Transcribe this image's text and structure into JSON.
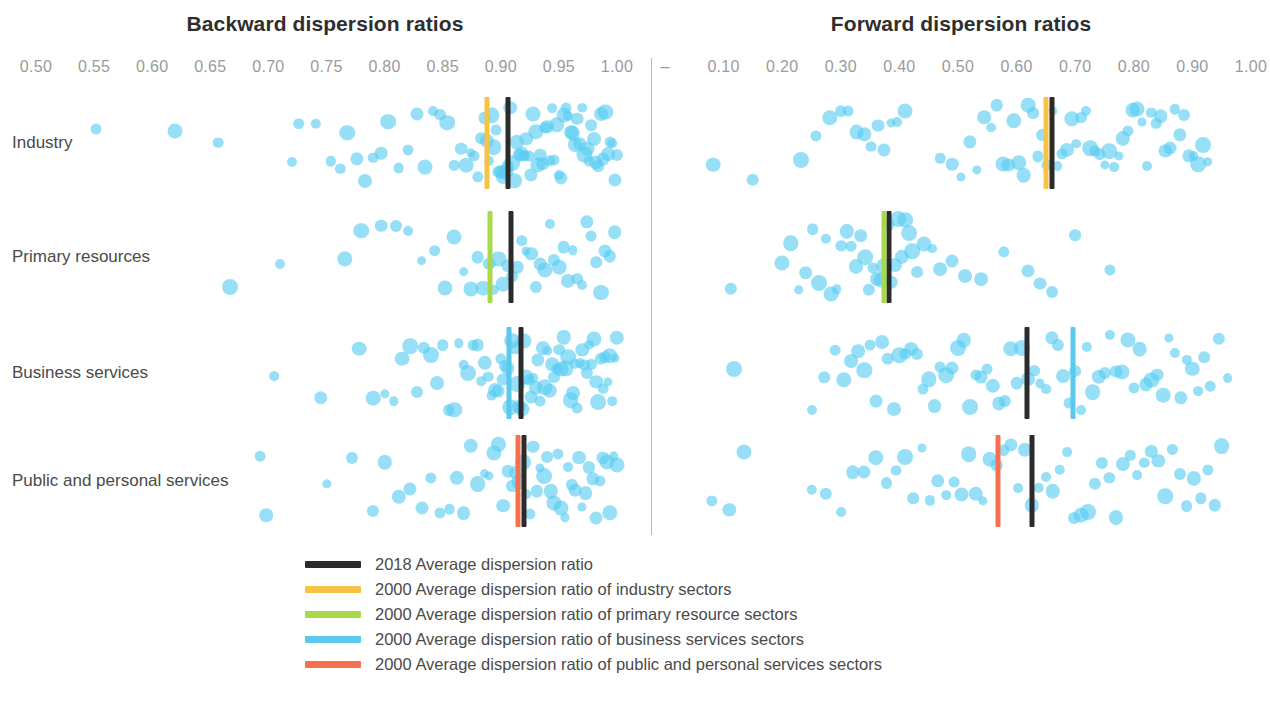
{
  "chart_data": {
    "type": "scatter",
    "panels": [
      {
        "name": "backward",
        "title": "Backward dispersion ratios",
        "xlabel": "",
        "xlim": [
          0.475,
          1.015
        ],
        "ticks": [
          {
            "value": 0.5,
            "label": "0.50"
          },
          {
            "value": 0.55,
            "label": "0.55"
          },
          {
            "value": 0.6,
            "label": "0.60"
          },
          {
            "value": 0.65,
            "label": "0.65"
          },
          {
            "value": 0.7,
            "label": "0.70"
          },
          {
            "value": 0.75,
            "label": "0.75"
          },
          {
            "value": 0.8,
            "label": "0.80"
          },
          {
            "value": 0.85,
            "label": "0.85"
          },
          {
            "value": 0.9,
            "label": "0.90"
          },
          {
            "value": 0.95,
            "label": "0.95"
          },
          {
            "value": 1.0,
            "label": "1.00"
          }
        ]
      },
      {
        "name": "forward",
        "title": "Forward dispersion ratios",
        "xlabel": "",
        "xlim": [
          0.0,
          1.03
        ],
        "ticks": [
          {
            "value": 0.0,
            "label": "–"
          },
          {
            "value": 0.1,
            "label": "0.10"
          },
          {
            "value": 0.2,
            "label": "0.20"
          },
          {
            "value": 0.3,
            "label": "0.30"
          },
          {
            "value": 0.4,
            "label": "0.40"
          },
          {
            "value": 0.5,
            "label": "0.50"
          },
          {
            "value": 0.6,
            "label": "0.60"
          },
          {
            "value": 0.7,
            "label": "0.70"
          },
          {
            "value": 0.8,
            "label": "0.80"
          },
          {
            "value": 0.9,
            "label": "0.90"
          },
          {
            "value": 1.0,
            "label": "1.00"
          }
        ]
      }
    ],
    "categories": [
      "Industry",
      "Primary resources",
      "Business services",
      "Public and personal services"
    ],
    "grid": false,
    "legend_position": "bottom",
    "colors": {
      "dots": "#57ccf2",
      "black": "#2b2b2b",
      "yellow": "#f7c344",
      "green": "#a9d94a",
      "blue": "#5bc8ef",
      "orange": "#f4714f"
    },
    "rows": [
      {
        "category": "Industry",
        "backward": {
          "markers": [
            {
              "series": "2018 Average dispersion ratio",
              "color": "black",
              "value": 0.906
            },
            {
              "series": "2000 Average dispersion ratio of industry sectors",
              "color": "yellow",
              "value": 0.888
            }
          ],
          "points": [
            0.552,
            0.62,
            0.657,
            0.72,
            0.726,
            0.741,
            0.754,
            0.762,
            0.768,
            0.776,
            0.783,
            0.79,
            0.797,
            0.803,
            0.812,
            0.82,
            0.828,
            0.835,
            0.842,
            0.848,
            0.854,
            0.86,
            0.866,
            0.87,
            0.874,
            0.877,
            0.88,
            0.883,
            0.886,
            0.888,
            0.89,
            0.892,
            0.894,
            0.896,
            0.898,
            0.9,
            0.902,
            0.904,
            0.906,
            0.908,
            0.91,
            0.912,
            0.914,
            0.916,
            0.918,
            0.92,
            0.922,
            0.924,
            0.926,
            0.928,
            0.93,
            0.932,
            0.934,
            0.936,
            0.938,
            0.94,
            0.942,
            0.944,
            0.946,
            0.948,
            0.95,
            0.952,
            0.954,
            0.956,
            0.958,
            0.96,
            0.962,
            0.964,
            0.966,
            0.968,
            0.97,
            0.972,
            0.974,
            0.976,
            0.978,
            0.98,
            0.982,
            0.984,
            0.986,
            0.988,
            0.99,
            0.992,
            0.994,
            0.996,
            0.998,
            1.0
          ]
        },
        "forward": {
          "markers": [
            {
              "series": "2018 Average dispersion ratio",
              "color": "black",
              "value": 0.66
            },
            {
              "series": "2000 Average dispersion ratio of industry sectors",
              "color": "yellow",
              "value": 0.65
            }
          ],
          "points": [
            0.082,
            0.15,
            0.232,
            0.258,
            0.281,
            0.3,
            0.312,
            0.327,
            0.34,
            0.352,
            0.363,
            0.374,
            0.385,
            0.396,
            0.41,
            0.47,
            0.49,
            0.505,
            0.52,
            0.532,
            0.545,
            0.556,
            0.566,
            0.576,
            0.586,
            0.595,
            0.604,
            0.612,
            0.62,
            0.628,
            0.636,
            0.644,
            0.652,
            0.662,
            0.67,
            0.678,
            0.686,
            0.694,
            0.702,
            0.71,
            0.718,
            0.726,
            0.734,
            0.742,
            0.75,
            0.758,
            0.766,
            0.774,
            0.782,
            0.79,
            0.798,
            0.806,
            0.814,
            0.822,
            0.83,
            0.838,
            0.846,
            0.854,
            0.862,
            0.87,
            0.878,
            0.886,
            0.894,
            0.902,
            0.91,
            0.918,
            0.926
          ]
        }
      },
      {
        "category": "Primary resources",
        "backward": {
          "markers": [
            {
              "series": "2018 Average dispersion ratio",
              "color": "black",
              "value": 0.909
            },
            {
              "series": "2000 Average dispersion ratio of primary resource sectors",
              "color": "green",
              "value": 0.891
            }
          ],
          "points": [
            0.667,
            0.71,
            0.766,
            0.78,
            0.797,
            0.81,
            0.82,
            0.832,
            0.843,
            0.852,
            0.86,
            0.868,
            0.874,
            0.88,
            0.885,
            0.89,
            0.894,
            0.898,
            0.902,
            0.906,
            0.91,
            0.914,
            0.918,
            0.922,
            0.926,
            0.93,
            0.934,
            0.938,
            0.942,
            0.946,
            0.95,
            0.954,
            0.958,
            0.962,
            0.966,
            0.97,
            0.974,
            0.978,
            0.982,
            0.986,
            0.99,
            0.994,
            0.998
          ]
        },
        "forward": {
          "markers": [
            {
              "series": "2018 Average dispersion ratio",
              "color": "black",
              "value": 0.382
            },
            {
              "series": "2000 Average dispersion ratio of primary resource sectors",
              "color": "green",
              "value": 0.374
            }
          ],
          "points": [
            0.112,
            0.2,
            0.215,
            0.228,
            0.24,
            0.252,
            0.263,
            0.274,
            0.284,
            0.293,
            0.301,
            0.31,
            0.318,
            0.326,
            0.334,
            0.341,
            0.348,
            0.355,
            0.362,
            0.368,
            0.374,
            0.38,
            0.386,
            0.392,
            0.398,
            0.404,
            0.41,
            0.416,
            0.422,
            0.43,
            0.442,
            0.456,
            0.47,
            0.49,
            0.512,
            0.54,
            0.578,
            0.62,
            0.64,
            0.66,
            0.7,
            0.76
          ]
        }
      },
      {
        "category": "Business services",
        "backward": {
          "markers": [
            {
              "series": "2018 Average dispersion ratio",
              "color": "black",
              "value": 0.917
            },
            {
              "series": "2000 Average dispersion ratio of business services sectors",
              "color": "blue",
              "value": 0.907
            }
          ],
          "points": [
            0.705,
            0.745,
            0.778,
            0.79,
            0.8,
            0.808,
            0.815,
            0.822,
            0.828,
            0.834,
            0.84,
            0.845,
            0.85,
            0.855,
            0.86,
            0.864,
            0.868,
            0.872,
            0.876,
            0.88,
            0.883,
            0.886,
            0.889,
            0.892,
            0.895,
            0.898,
            0.9,
            0.902,
            0.904,
            0.906,
            0.908,
            0.91,
            0.912,
            0.914,
            0.916,
            0.918,
            0.92,
            0.922,
            0.924,
            0.926,
            0.928,
            0.93,
            0.932,
            0.934,
            0.936,
            0.938,
            0.94,
            0.942,
            0.944,
            0.946,
            0.948,
            0.95,
            0.952,
            0.954,
            0.956,
            0.958,
            0.96,
            0.962,
            0.964,
            0.966,
            0.968,
            0.97,
            0.972,
            0.974,
            0.976,
            0.978,
            0.98,
            0.982,
            0.984,
            0.986,
            0.988,
            0.99,
            0.992,
            0.994,
            0.996,
            0.998,
            1.0
          ]
        },
        "forward": {
          "markers": [
            {
              "series": "2018 Average dispersion ratio",
              "color": "black",
              "value": 0.618
            },
            {
              "series": "2000 Average dispersion ratio of business services sectors",
              "color": "blue",
              "value": 0.697
            }
          ],
          "points": [
            0.118,
            0.25,
            0.272,
            0.29,
            0.305,
            0.318,
            0.33,
            0.34,
            0.35,
            0.36,
            0.37,
            0.38,
            0.39,
            0.4,
            0.41,
            0.42,
            0.43,
            0.44,
            0.45,
            0.46,
            0.47,
            0.48,
            0.49,
            0.5,
            0.51,
            0.52,
            0.53,
            0.54,
            0.55,
            0.56,
            0.57,
            0.58,
            0.59,
            0.6,
            0.61,
            0.62,
            0.63,
            0.64,
            0.65,
            0.66,
            0.67,
            0.68,
            0.69,
            0.7,
            0.71,
            0.72,
            0.73,
            0.74,
            0.75,
            0.76,
            0.77,
            0.78,
            0.79,
            0.8,
            0.81,
            0.82,
            0.83,
            0.84,
            0.85,
            0.86,
            0.87,
            0.88,
            0.89,
            0.9,
            0.91,
            0.92,
            0.93,
            0.945,
            0.96
          ]
        }
      },
      {
        "category": "Public and personal services",
        "backward": {
          "markers": [
            {
              "series": "2018 Average dispersion ratio",
              "color": "black",
              "value": 0.92
            },
            {
              "series": "2000 Average dispersion ratio of public and personal services sectors",
              "color": "orange",
              "value": 0.915
            }
          ],
          "points": [
            0.693,
            0.698,
            0.75,
            0.772,
            0.79,
            0.8,
            0.812,
            0.822,
            0.832,
            0.84,
            0.848,
            0.856,
            0.862,
            0.868,
            0.874,
            0.88,
            0.886,
            0.89,
            0.894,
            0.898,
            0.902,
            0.906,
            0.91,
            0.913,
            0.916,
            0.919,
            0.922,
            0.925,
            0.928,
            0.931,
            0.934,
            0.937,
            0.94,
            0.943,
            0.946,
            0.949,
            0.952,
            0.955,
            0.958,
            0.961,
            0.964,
            0.967,
            0.97,
            0.973,
            0.976,
            0.979,
            0.982,
            0.985,
            0.988,
            0.991,
            0.994,
            0.997,
            1.0
          ]
        },
        "forward": {
          "markers": [
            {
              "series": "2018 Average dispersion ratio",
              "color": "black",
              "value": 0.626
            },
            {
              "series": "2000 Average dispersion ratio of public and personal services sectors",
              "color": "orange",
              "value": 0.568
            }
          ],
          "points": [
            0.08,
            0.11,
            0.135,
            0.25,
            0.275,
            0.3,
            0.32,
            0.34,
            0.36,
            0.378,
            0.394,
            0.41,
            0.424,
            0.438,
            0.452,
            0.466,
            0.48,
            0.494,
            0.506,
            0.518,
            0.53,
            0.542,
            0.554,
            0.566,
            0.578,
            0.59,
            0.602,
            0.614,
            0.626,
            0.638,
            0.65,
            0.662,
            0.674,
            0.686,
            0.698,
            0.71,
            0.722,
            0.734,
            0.746,
            0.758,
            0.77,
            0.782,
            0.794,
            0.806,
            0.818,
            0.83,
            0.842,
            0.854,
            0.866,
            0.878,
            0.89,
            0.902,
            0.914,
            0.926,
            0.938,
            0.95
          ]
        }
      }
    ],
    "legend": [
      {
        "label": "2018 Average dispersion ratio",
        "color": "#2b2b2b"
      },
      {
        "label": "2000 Average dispersion ratio of industry sectors",
        "color": "#f7c344"
      },
      {
        "label": "2000 Average dispersion ratio of primary resource sectors",
        "color": "#a9d94a"
      },
      {
        "label": "2000 Average dispersion ratio of business services sectors",
        "color": "#5bc8ef"
      },
      {
        "label": "2000 Average dispersion ratio of public and personal services sectors",
        "color": "#f4714f"
      }
    ]
  }
}
